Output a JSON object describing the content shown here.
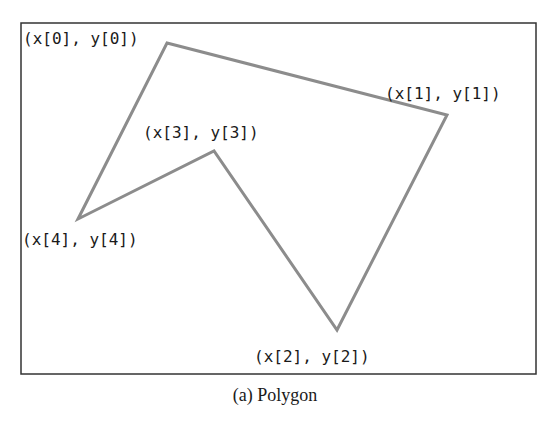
{
  "figure": {
    "caption": "(a) Polygon",
    "frame": {
      "x": 21,
      "y": 23,
      "width": 515,
      "height": 351,
      "stroke": "#333333"
    },
    "polygon": {
      "stroke": "#8c8c8c",
      "stroke_width": 3,
      "points": "167,43 447,115 337,330 214,151 78,219"
    },
    "vertices": [
      {
        "label": "(x[0], y[0])",
        "x": 167,
        "y": 43,
        "label_x": 23,
        "label_y": 44
      },
      {
        "label": "(x[1], y[1])",
        "x": 447,
        "y": 115,
        "label_x": 385,
        "label_y": 99
      },
      {
        "label": "(x[2], y[2])",
        "x": 337,
        "y": 330,
        "label_x": 254,
        "label_y": 362
      },
      {
        "label": "(x[3], y[3])",
        "x": 214,
        "y": 151,
        "label_x": 143,
        "label_y": 138
      },
      {
        "label": "(x[4], y[4])",
        "x": 78,
        "y": 219,
        "label_x": 22,
        "label_y": 245
      }
    ]
  }
}
